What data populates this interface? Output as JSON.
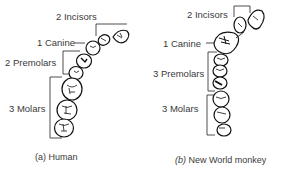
{
  "panels": [
    {
      "id": "a",
      "caption_letter": "(a)",
      "caption_text": "Human",
      "labels": {
        "incisors": "2 Incisors",
        "canine": "1 Canine",
        "premolars": "2 Premolars",
        "molars": "3 Molars"
      }
    },
    {
      "id": "b",
      "caption_letter": "(b)",
      "caption_text": "New World monkey",
      "labels": {
        "incisors": "2 Incisors",
        "canine": "1 Canine",
        "premolars": "3 Premolars",
        "molars": "3 Molars"
      }
    }
  ]
}
